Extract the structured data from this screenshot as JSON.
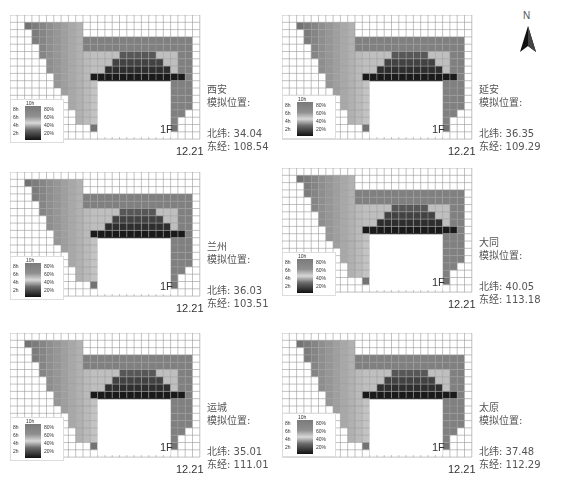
{
  "north_arrow": {
    "label": "N"
  },
  "legend": {
    "top": "10h",
    "left_ticks": [
      "8h",
      "6h",
      "4h",
      "2h"
    ],
    "right_ticks": [
      "80%",
      "60%",
      "40%",
      "20%"
    ]
  },
  "common": {
    "floor_label": "1F",
    "date_label": "12.21",
    "sim_label": "模拟位置:"
  },
  "panels": [
    {
      "city": "西安",
      "lat_label": "北纬:",
      "lat": "34.04",
      "lon_label": "东经:",
      "lon": "108.54",
      "x": 10,
      "y": 15
    },
    {
      "city": "延安",
      "lat_label": "北纬:",
      "lat": "36.35",
      "lon_label": "东经:",
      "lon": "109.29",
      "x": 282,
      "y": 15
    },
    {
      "city": "兰州",
      "lat_label": "北纬:",
      "lat": "36.03",
      "lon_label": "东经:",
      "lon": "103.51",
      "x": 10,
      "y": 172
    },
    {
      "city": "大同",
      "lat_label": "北纬:",
      "lat": "40.05",
      "lon_label": "东经:",
      "lon": "113.18",
      "x": 282,
      "y": 168
    },
    {
      "city": "运城",
      "lat_label": "北纬:",
      "lat": "35.01",
      "lon_label": "东经:",
      "lon": "111.01",
      "x": 10,
      "y": 333
    },
    {
      "city": "太原",
      "lat_label": "北纬:",
      "lat": "37.48",
      "lon_label": "东经:",
      "lon": "112.29",
      "x": 282,
      "y": 333
    }
  ]
}
